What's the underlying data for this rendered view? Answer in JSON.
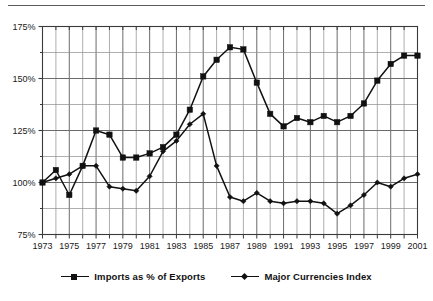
{
  "figure": {
    "background_color": "#ffffff",
    "ink_color": "#111111",
    "grid_color": "#6b6b6b",
    "minor_grid_color": "#8c8c8c",
    "top_rule_color": "#5a5a5a"
  },
  "legend": {
    "position": "bottom-center",
    "entries": [
      {
        "label": "Imports as % of Exports",
        "marker": "square-marker",
        "marker_icon": "square-marker-icon"
      },
      {
        "label": "Major Currencies Index",
        "marker": "diamond-marker",
        "marker_icon": "diamond-marker-icon"
      }
    ]
  },
  "axes": {
    "y_ticks": [
      "175%",
      "150%",
      "125%",
      "100%",
      "75%"
    ],
    "y_tick_values": [
      175,
      150,
      125,
      100,
      75
    ],
    "x_ticks": [
      "1973",
      "1975",
      "1977",
      "1979",
      "1981",
      "1983",
      "1985",
      "1987",
      "1989",
      "1991",
      "1993",
      "1995",
      "1997",
      "1999",
      "2001"
    ]
  },
  "chart_data": {
    "type": "line",
    "title": "",
    "subtitle": "",
    "xlabel": "",
    "ylabel": "",
    "xlim": [
      1973,
      2001
    ],
    "ylim": [
      75,
      175
    ],
    "grid": true,
    "minor_grid": true,
    "legend_position": "bottom-center",
    "x": [
      1973,
      1974,
      1975,
      1976,
      1977,
      1978,
      1979,
      1980,
      1981,
      1982,
      1983,
      1984,
      1985,
      1986,
      1987,
      1988,
      1989,
      1990,
      1991,
      1992,
      1993,
      1994,
      1995,
      1996,
      1997,
      1998,
      1999,
      2000,
      2001
    ],
    "categories": [
      "1973",
      "1974",
      "1975",
      "1976",
      "1977",
      "1978",
      "1979",
      "1980",
      "1981",
      "1982",
      "1983",
      "1984",
      "1985",
      "1986",
      "1987",
      "1988",
      "1989",
      "1990",
      "1991",
      "1992",
      "1993",
      "1994",
      "1995",
      "1996",
      "1997",
      "1998",
      "1999",
      "2000",
      "2001"
    ],
    "series": [
      {
        "name": "Imports as % of Exports",
        "marker": "square",
        "values": [
          100,
          106,
          94,
          108,
          125,
          123,
          112,
          112,
          114,
          117,
          123,
          135,
          151,
          159,
          165,
          164,
          148,
          133,
          127,
          131,
          129,
          132,
          129,
          132,
          138,
          149,
          157,
          161,
          161
        ]
      },
      {
        "name": "Major Currencies Index",
        "marker": "diamond",
        "values": [
          100,
          102,
          104,
          108,
          108,
          98,
          97,
          96,
          103,
          115,
          120,
          128,
          133,
          108,
          93,
          91,
          95,
          91,
          90,
          91,
          91,
          90,
          85,
          89,
          94,
          100,
          98,
          102,
          104
        ]
      }
    ]
  }
}
